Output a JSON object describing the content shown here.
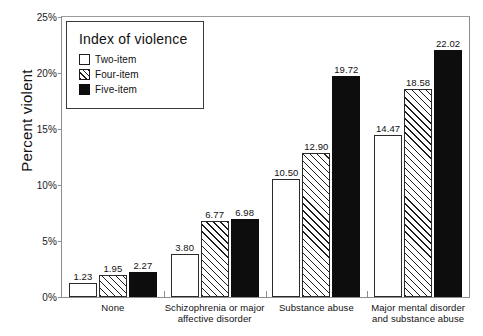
{
  "chart_data": {
    "type": "bar",
    "title": "",
    "xlabel": "",
    "ylabel": "Percent violent",
    "ylim": [
      0,
      25
    ],
    "ytick_labels": [
      "0%",
      "5%",
      "10%",
      "15%",
      "20%",
      "25%"
    ],
    "ytick_values": [
      0,
      5,
      10,
      15,
      20,
      25
    ],
    "grid": false,
    "legend_position": "top-left",
    "legend_title": "Index of violence",
    "categories": [
      "None",
      "Schizophrenia or major affective disorder",
      "Substance abuse",
      "Major mental disorder and substance abuse"
    ],
    "category_lines": [
      [
        "None"
      ],
      [
        "Schizophrenia or major",
        "affective disorder"
      ],
      [
        "Substance abuse"
      ],
      [
        "Major mental disorder",
        "and substance abuse"
      ]
    ],
    "series": [
      {
        "name": "Two-item",
        "fill": "white",
        "values": [
          1.23,
          3.8,
          10.5,
          14.47
        ],
        "labels": [
          "1.23",
          "3.80",
          "10.50",
          "14.47"
        ]
      },
      {
        "name": "Four-item",
        "fill": "hatched",
        "values": [
          1.95,
          6.77,
          12.9,
          18.58
        ],
        "labels": [
          "1.95",
          "6.77",
          "12.90",
          "18.58"
        ]
      },
      {
        "name": "Five-item",
        "fill": "black",
        "values": [
          2.27,
          6.98,
          19.72,
          22.02
        ],
        "labels": [
          "2.27",
          "6.98",
          "19.72",
          "22.02"
        ]
      }
    ],
    "colors": {
      "two_item": "#ffffff",
      "four_item": "#ffffff",
      "five_item": "#0d0d0d",
      "outline": "#2a2a2a",
      "frame": "#8d8d8d",
      "text": "#111111"
    }
  }
}
